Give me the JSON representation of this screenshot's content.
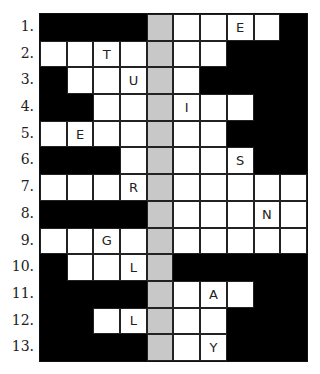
{
  "puzzle": {
    "row_numbers": [
      "1.",
      "2.",
      "3.",
      "4.",
      "5.",
      "6.",
      "7.",
      "8.",
      "9.",
      "10.",
      "11.",
      "12.",
      "13."
    ],
    "highlight_column": 4,
    "legend": {
      "#": "black",
      "_": "white",
      "G": "gray-highlight"
    },
    "grid": [
      [
        "#",
        "#",
        "#",
        "#",
        "G",
        "_",
        "_",
        "E",
        "_",
        "#"
      ],
      [
        "_",
        "_",
        "T",
        "_",
        "G",
        "_",
        "_",
        "#",
        "#",
        "#"
      ],
      [
        "#",
        "_",
        "_",
        "U",
        "G",
        "_",
        "#",
        "#",
        "#",
        "#"
      ],
      [
        "#",
        "#",
        "_",
        "_",
        "G",
        "I",
        "_",
        "_",
        "#",
        "#"
      ],
      [
        "_",
        "E",
        "_",
        "_",
        "G",
        "_",
        "_",
        "#",
        "#",
        "#"
      ],
      [
        "#",
        "#",
        "#",
        "_",
        "G",
        "_",
        "_",
        "S",
        "#",
        "#"
      ],
      [
        "_",
        "_",
        "_",
        "R",
        "G",
        "_",
        "_",
        "_",
        "_",
        "_"
      ],
      [
        "#",
        "#",
        "#",
        "#",
        "G",
        "_",
        "_",
        "_",
        "N",
        "_"
      ],
      [
        "_",
        "_",
        "G:",
        "_",
        "G",
        "_",
        "_",
        "_",
        "_",
        "_"
      ],
      [
        "#",
        "_",
        "_",
        "L",
        "G",
        "#",
        "#",
        "#",
        "#",
        "#"
      ],
      [
        "#",
        "#",
        "#",
        "#",
        "G",
        "_",
        "A",
        "_",
        "#",
        "#"
      ],
      [
        "#",
        "#",
        "_",
        "L",
        "G",
        "_",
        "_",
        "#",
        "#",
        "#"
      ],
      [
        "#",
        "#",
        "#",
        "#",
        "G",
        "_",
        "Y",
        "#",
        "#",
        "#"
      ]
    ],
    "letters": [
      {
        "row": 1,
        "col": 7,
        "letter": "E"
      },
      {
        "row": 2,
        "col": 2,
        "letter": "T"
      },
      {
        "row": 3,
        "col": 3,
        "letter": "U"
      },
      {
        "row": 4,
        "col": 5,
        "letter": "I"
      },
      {
        "row": 5,
        "col": 1,
        "letter": "E"
      },
      {
        "row": 6,
        "col": 7,
        "letter": "S"
      },
      {
        "row": 7,
        "col": 3,
        "letter": "R"
      },
      {
        "row": 8,
        "col": 8,
        "letter": "N"
      },
      {
        "row": 9,
        "col": 2,
        "letter": "G"
      },
      {
        "row": 10,
        "col": 3,
        "letter": "L"
      },
      {
        "row": 11,
        "col": 6,
        "letter": "A"
      },
      {
        "row": 12,
        "col": 3,
        "letter": "L"
      },
      {
        "row": 13,
        "col": 6,
        "letter": "Y"
      }
    ]
  }
}
